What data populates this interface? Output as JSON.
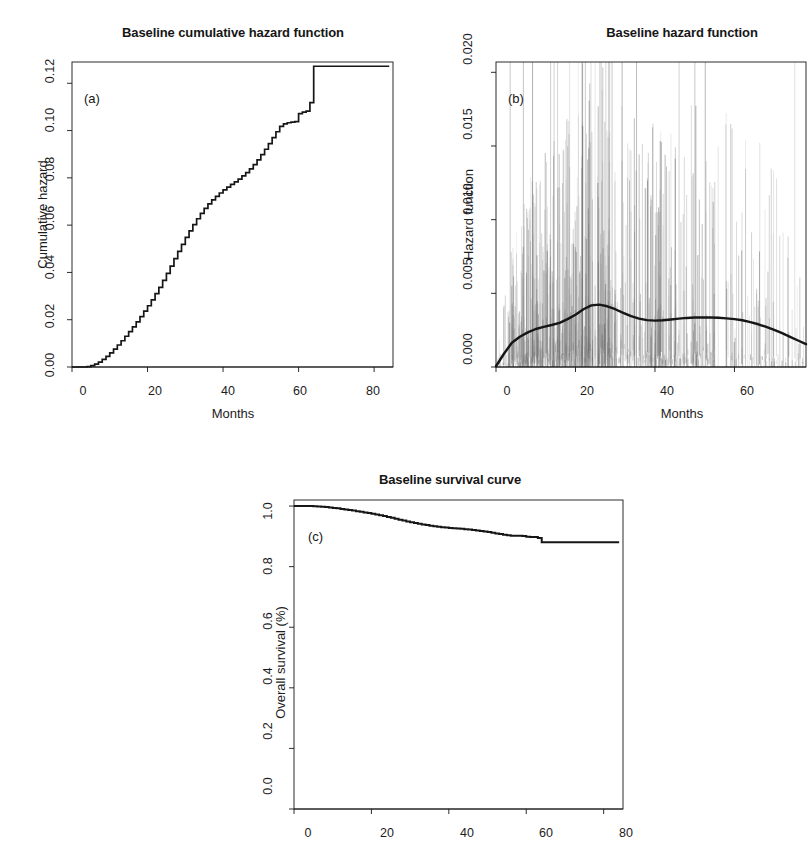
{
  "figure": {
    "background": "#ffffff",
    "ink": "#161616",
    "spike_color": "#6f6f6f"
  },
  "panels": [
    {
      "tag": "(a)",
      "title": "Baseline cumulative hazard function",
      "xlabel": "Months",
      "ylabel": "Cumulative hazard",
      "xticks": [
        "0",
        "20",
        "40",
        "60",
        "80"
      ],
      "yticks": [
        "0.00",
        "0.02",
        "0.04",
        "0.06",
        "0.08",
        "0.10",
        "0.12"
      ]
    },
    {
      "tag": "(b)",
      "title": "Baseline hazard function",
      "xlabel": "Months",
      "ylabel": "Hazard function",
      "xticks": [
        "0",
        "20",
        "40",
        "60"
      ],
      "yticks": [
        "0.000",
        "0.005",
        "0.010",
        "0.015",
        "0.020"
      ]
    },
    {
      "tag": "(c)",
      "title": "Baseline survival curve",
      "xlabel": "Months",
      "ylabel": "Overall survival (%)",
      "xticks": [
        "0",
        "20",
        "40",
        "60",
        "80"
      ],
      "yticks": [
        "0.0",
        "0.2",
        "0.4",
        "0.6",
        "0.8",
        "1.0"
      ]
    }
  ],
  "chart_data": [
    {
      "type": "line",
      "panel": "(a)",
      "title": "Baseline cumulative hazard function",
      "xlabel": "Months",
      "ylabel": "Cumulative hazard",
      "xlim": [
        0,
        85
      ],
      "ylim": [
        0.0,
        0.129
      ],
      "xticks": [
        0,
        20,
        40,
        60,
        80
      ],
      "yticks": [
        0.0,
        0.02,
        0.04,
        0.06,
        0.08,
        0.1,
        0.12
      ],
      "grid": false,
      "legend": "none",
      "step": true,
      "x": [
        0,
        2,
        4,
        5,
        6,
        7,
        8,
        9,
        10,
        11,
        12,
        13,
        14,
        15,
        16,
        17,
        18,
        19,
        20,
        21,
        22,
        23,
        24,
        25,
        26,
        27,
        28,
        29,
        30,
        31,
        32,
        33,
        34,
        35,
        36,
        37,
        38,
        39,
        40,
        41,
        42,
        43,
        44,
        45,
        46,
        47,
        48,
        49,
        50,
        51,
        52,
        53,
        54,
        55,
        56,
        57,
        58,
        59,
        60,
        61,
        62,
        63,
        64,
        65,
        70,
        75,
        80,
        84
      ],
      "y": [
        0.0,
        0.0,
        0.0002,
        0.0006,
        0.0012,
        0.0021,
        0.0032,
        0.0045,
        0.006,
        0.0076,
        0.0093,
        0.0111,
        0.013,
        0.015,
        0.017,
        0.0191,
        0.0213,
        0.0236,
        0.0259,
        0.0284,
        0.031,
        0.0337,
        0.0366,
        0.0396,
        0.0427,
        0.0458,
        0.0489,
        0.0519,
        0.0548,
        0.0576,
        0.0602,
        0.0627,
        0.065,
        0.0671,
        0.069,
        0.0707,
        0.0722,
        0.0736,
        0.0749,
        0.0761,
        0.0772,
        0.0783,
        0.0795,
        0.0808,
        0.0822,
        0.0838,
        0.0856,
        0.0876,
        0.0898,
        0.0921,
        0.0945,
        0.097,
        0.0995,
        0.1018,
        0.1028,
        0.1033,
        0.1036,
        0.1038,
        0.1072,
        0.1078,
        0.1082,
        0.1118,
        0.1272,
        0.1272,
        0.1272,
        0.1272,
        0.1272,
        0.1272
      ]
    },
    {
      "type": "line",
      "panel": "(b)",
      "title": "Baseline hazard function",
      "xlabel": "Months",
      "ylabel": "Hazard function",
      "xlim": [
        0,
        78
      ],
      "ylim": [
        0.0,
        0.0207
      ],
      "xticks": [
        0,
        20,
        40,
        60
      ],
      "yticks": [
        0.0,
        0.005,
        0.01,
        0.015,
        0.02
      ],
      "grid": false,
      "legend": "none",
      "note": "smooth kernel-smoothed hazard estimate over a dense background of individual vertical contribution spikes",
      "x": [
        0,
        2,
        4,
        6,
        8,
        10,
        12,
        14,
        16,
        18,
        20,
        22,
        24,
        26,
        28,
        30,
        32,
        34,
        36,
        38,
        40,
        42,
        44,
        46,
        48,
        50,
        52,
        54,
        56,
        58,
        60,
        62,
        64,
        66,
        68,
        70,
        72,
        74,
        76,
        78
      ],
      "y": [
        5e-05,
        0.0009,
        0.00165,
        0.00205,
        0.00235,
        0.00258,
        0.00272,
        0.00285,
        0.003,
        0.00325,
        0.00355,
        0.00392,
        0.00418,
        0.00423,
        0.00412,
        0.00392,
        0.00368,
        0.00345,
        0.00328,
        0.00318,
        0.00315,
        0.00317,
        0.00322,
        0.00328,
        0.00333,
        0.00336,
        0.00337,
        0.00336,
        0.00334,
        0.0033,
        0.00325,
        0.00317,
        0.00305,
        0.0029,
        0.00272,
        0.00252,
        0.0023,
        0.00205,
        0.0018,
        0.00155
      ]
    },
    {
      "type": "line",
      "panel": "(c)",
      "title": "Baseline survival curve",
      "xlabel": "Months",
      "ylabel": "Overall survival (%)",
      "xlim": [
        0,
        85
      ],
      "ylim": [
        0.0,
        1.02
      ],
      "xticks": [
        0,
        20,
        40,
        60,
        80
      ],
      "yticks": [
        0.0,
        0.2,
        0.4,
        0.6,
        0.8,
        1.0
      ],
      "grid": false,
      "legend": "none",
      "step": true,
      "x": [
        0,
        2,
        4,
        5,
        6,
        7,
        8,
        9,
        10,
        11,
        12,
        13,
        14,
        15,
        16,
        17,
        18,
        19,
        20,
        21,
        22,
        23,
        24,
        25,
        26,
        27,
        28,
        29,
        30,
        31,
        32,
        33,
        34,
        35,
        36,
        37,
        38,
        39,
        40,
        41,
        42,
        43,
        44,
        45,
        46,
        47,
        48,
        49,
        50,
        51,
        52,
        53,
        54,
        55,
        56,
        57,
        58,
        59,
        60,
        61,
        62,
        63,
        64,
        65,
        70,
        75,
        80,
        84
      ],
      "y": [
        1.0,
        1.0,
        0.9998,
        0.9994,
        0.9988,
        0.9979,
        0.9968,
        0.9955,
        0.994,
        0.9924,
        0.9907,
        0.989,
        0.9871,
        0.9851,
        0.9831,
        0.9811,
        0.9789,
        0.9767,
        0.9744,
        0.972,
        0.9695,
        0.9669,
        0.9641,
        0.9612,
        0.9582,
        0.9552,
        0.9523,
        0.9494,
        0.9467,
        0.944,
        0.9416,
        0.9392,
        0.9371,
        0.9351,
        0.9334,
        0.9317,
        0.9303,
        0.929,
        0.9278,
        0.9267,
        0.9257,
        0.9247,
        0.9236,
        0.9224,
        0.9212,
        0.9197,
        0.918,
        0.9162,
        0.9141,
        0.912,
        0.9098,
        0.9076,
        0.9053,
        0.9033,
        0.9024,
        0.9019,
        0.9017,
        0.9015,
        0.8984,
        0.8979,
        0.8976,
        0.8943,
        0.8806,
        0.8806,
        0.8806,
        0.8806,
        0.8806,
        0.8806
      ]
    }
  ]
}
